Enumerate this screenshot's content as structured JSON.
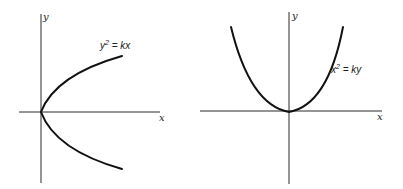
{
  "figures": [
    {
      "id": "left",
      "equation": {
        "base": "y",
        "exponent": "2",
        "rest": " = kx"
      },
      "x_axis_label": "x",
      "y_axis_label": "y",
      "orientation": "opens right"
    },
    {
      "id": "right",
      "equation": {
        "base": "x",
        "exponent": "2",
        "rest": " = ky"
      },
      "x_axis_label": "x",
      "y_axis_label": "y",
      "orientation": "opens up"
    }
  ],
  "colors": {
    "axis": "#2a2a2a",
    "curve": "#111111",
    "background": "#ffffff"
  }
}
